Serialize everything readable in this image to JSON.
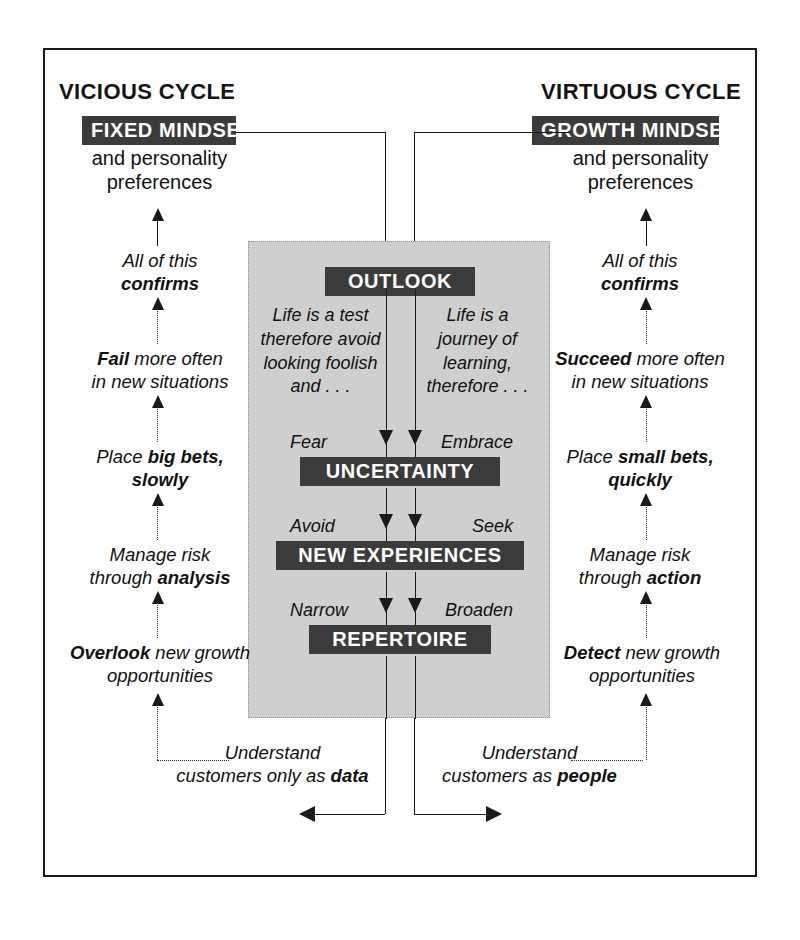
{
  "diagram": {
    "title_left": "VICIOUS CYCLE",
    "title_right": "VIRTUOUS CYCLE",
    "left": {
      "mindset_chip": "FIXED MINDSET",
      "mindset_sub_line1": "and personality",
      "mindset_sub_line2": "preferences",
      "steps": [
        {
          "line1": "All of this",
          "line2_bold": "confirms"
        },
        {
          "line1_bold": "Fail",
          "line1_rest": " more often",
          "line2": "in new situations"
        },
        {
          "line1": "Place ",
          "line1_bold": "big bets,",
          "line2_bold": "slowly"
        },
        {
          "line1": "Manage risk",
          "line2": "through ",
          "line2_bold": "analysis"
        },
        {
          "line1_bold": "Overlook",
          "line1_rest": " new growth",
          "line2": "opportunities"
        }
      ],
      "footer_line1": "Understand",
      "footer_line2": "customers only as ",
      "footer_line2_bold": "data"
    },
    "right": {
      "mindset_chip": "GROWTH MINDSET",
      "mindset_sub_line1": "and personality",
      "mindset_sub_line2": "preferences",
      "steps": [
        {
          "line1": "All of this",
          "line2_bold": "confirms"
        },
        {
          "line1_bold": "Succeed",
          "line1_rest": " more often",
          "line2": "in new situations"
        },
        {
          "line1": "Place ",
          "line1_bold": "small bets,",
          "line2_bold": "quickly"
        },
        {
          "line1": "Manage risk",
          "line2": "through ",
          "line2_bold": "action"
        },
        {
          "line1_bold": "Detect",
          "line1_rest": " new growth",
          "line2": "opportunities"
        }
      ],
      "footer_line1": "Understand",
      "footer_line2": "customers as ",
      "footer_line2_bold": "people"
    },
    "center": {
      "outlook_chip": "OUTLOOK",
      "outlook_left_text": "Life is a test\ntherefore avoid\nlooking foolish\nand . . .",
      "outlook_right_text": "Life is a\njourney of\nlearning,\ntherefore . . .",
      "rows": [
        {
          "chip": "UNCERTAINTY",
          "left_tag": "Fear",
          "right_tag": "Embrace"
        },
        {
          "chip": "NEW EXPERIENCES",
          "left_tag": "Avoid",
          "right_tag": "Seek"
        },
        {
          "chip": "REPERTOIRE",
          "left_tag": "Narrow",
          "right_tag": "Broaden"
        }
      ]
    },
    "colors": {
      "chip_background": "#3b3b3b",
      "chip_text": "#ffffff",
      "panel_background": "#cfcfcf",
      "frame_border": "#1a1a1a",
      "page_background": "#ffffff"
    }
  }
}
